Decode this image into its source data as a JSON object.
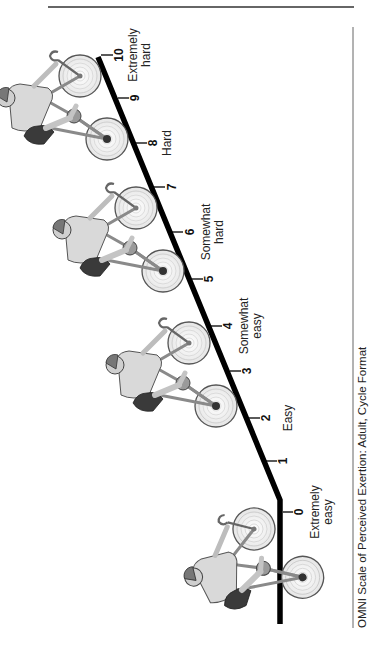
{
  "figure": {
    "caption": "OMNI Scale of Perceived Exertion: Adult, Cycle Format",
    "orientation": "rotated -90deg (landscape figure displayed in portrait)",
    "colors": {
      "line": "#000000",
      "rule": "#333333",
      "text": "#222222",
      "background": "#ffffff"
    }
  },
  "scale": {
    "ticks": [
      {
        "value": "0",
        "x": 280,
        "y": 512
      },
      {
        "value": "1",
        "x": 258,
        "y": 461
      },
      {
        "value": "2",
        "x": 240,
        "y": 418
      },
      {
        "value": "3",
        "x": 222,
        "y": 371
      },
      {
        "value": "4",
        "x": 203,
        "y": 326
      },
      {
        "value": "5",
        "x": 184,
        "y": 279
      },
      {
        "value": "6",
        "x": 165,
        "y": 232
      },
      {
        "value": "7",
        "x": 147,
        "y": 187
      },
      {
        "value": "8",
        "x": 129,
        "y": 143
      },
      {
        "value": "9",
        "x": 115,
        "y": 98
      },
      {
        "value": "10",
        "x": 98,
        "y": 55
      }
    ],
    "labels": [
      {
        "text_line1": "Extremely",
        "text_line2": "easy",
        "anchor_value": "0"
      },
      {
        "text_line1": "Easy",
        "text_line2": "",
        "anchor_value": "2"
      },
      {
        "text_line1": "Somewhat",
        "text_line2": "easy",
        "anchor_value": "4"
      },
      {
        "text_line1": "Somewhat",
        "text_line2": "hard",
        "anchor_value": "6"
      },
      {
        "text_line1": "Hard",
        "text_line2": "",
        "anchor_value": "8"
      },
      {
        "text_line1": "Extremely",
        "text_line2": "hard",
        "anchor_value": "10"
      }
    ]
  },
  "cyclists": [
    {
      "name": "cyclist-extremely-hard",
      "position": "near 9-10"
    },
    {
      "name": "cyclist-somewhat-hard",
      "position": "near 5-7"
    },
    {
      "name": "cyclist-somewhat-easy",
      "position": "near 3-4"
    },
    {
      "name": "cyclist-extremely-easy",
      "position": "near 0"
    }
  ]
}
